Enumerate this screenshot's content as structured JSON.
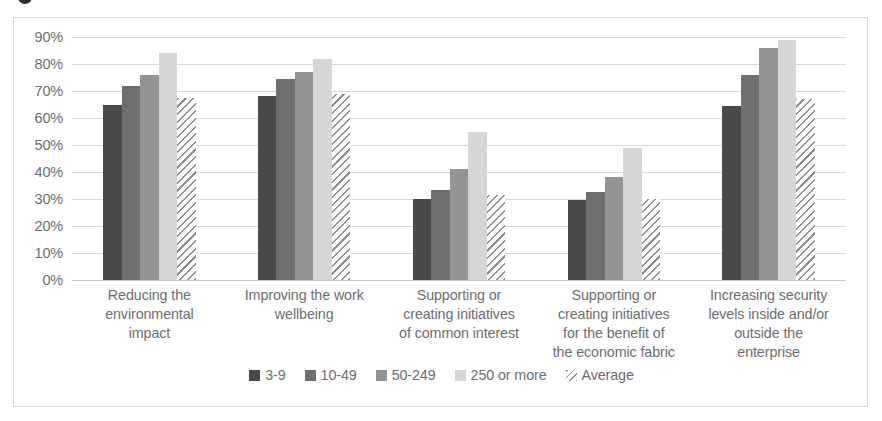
{
  "figure": {
    "title_fragment_icon": "cropped-glyph"
  },
  "chart_data": {
    "type": "bar",
    "title": "",
    "xlabel": "",
    "ylabel": "",
    "ylim": [
      0,
      90
    ],
    "grid": true,
    "legend_position": "bottom",
    "value_format": "percent",
    "categories": [
      "Reducing the environmental impact",
      "Improving the work wellbeing",
      "Supporting or creating initiatives of common interest",
      "Supporting or creating initiatives for the benefit of the economic fabric",
      "Increasing security levels inside and/or outside the enterprise"
    ],
    "category_lines": [
      [
        "Reducing the",
        "environmental",
        "impact"
      ],
      [
        "Improving the work",
        "wellbeing"
      ],
      [
        "Supporting or",
        "creating initiatives",
        "of common interest"
      ],
      [
        "Supporting or",
        "creating initiatives",
        "for the benefit of",
        "the economic fabric"
      ],
      [
        "Increasing security",
        "levels inside and/or",
        "outside the",
        "enterprise"
      ]
    ],
    "yticks": [
      0,
      10,
      20,
      30,
      40,
      50,
      60,
      70,
      80,
      90
    ],
    "ytick_labels": [
      "0%",
      "10%",
      "20%",
      "30%",
      "40%",
      "50%",
      "60%",
      "70%",
      "80%",
      "90%"
    ],
    "series": [
      {
        "name": "3-9",
        "color": "#4a4a4a",
        "pattern": "solid",
        "values": [
          65,
          68,
          30,
          29.5,
          64.5
        ]
      },
      {
        "name": "10-49",
        "color": "#6f6f6f",
        "pattern": "solid",
        "values": [
          72,
          74.5,
          33.5,
          32.5,
          76
        ]
      },
      {
        "name": "50-249",
        "color": "#949494",
        "pattern": "solid",
        "values": [
          76,
          77,
          41,
          38,
          86
        ]
      },
      {
        "name": "250 or more",
        "color": "#d6d6d6",
        "pattern": "solid",
        "values": [
          84,
          82,
          55,
          49,
          89
        ]
      },
      {
        "name": "Average",
        "color": "#8d8d8d",
        "pattern": "hatch",
        "values": [
          67.5,
          69,
          31.5,
          30,
          67
        ]
      }
    ]
  }
}
